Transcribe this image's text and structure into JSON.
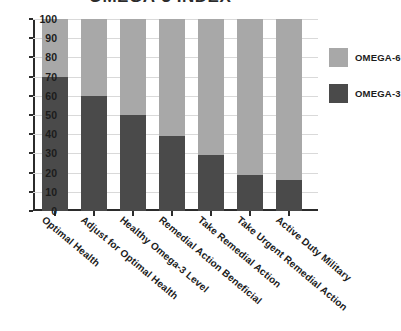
{
  "chart_data": {
    "type": "bar",
    "stacked": true,
    "title": "OMEGA-3 INDEX",
    "categories": [
      "Optimal Health",
      "Adjust for Optimal Health",
      "Healthy Omega-3 Level",
      "Remedial Action Beneficial",
      "Take Remedial Action",
      "Take Urgent Remedial Action",
      "Active Duty Military"
    ],
    "series": [
      {
        "name": "OMEGA-3",
        "color": "#4a4a4a",
        "values": [
          70,
          60,
          50,
          39,
          29,
          19,
          16
        ]
      },
      {
        "name": "OMEGA-6",
        "color": "#a8a8a8",
        "values": [
          30,
          40,
          50,
          61,
          71,
          81,
          84
        ]
      }
    ],
    "xlabel": "",
    "ylabel": "",
    "ylim": [
      0,
      100
    ],
    "yticks": [
      0,
      10,
      20,
      30,
      40,
      50,
      60,
      70,
      80,
      90,
      100
    ],
    "ytick_labels": [
      "0",
      "10",
      "20",
      "30",
      "40",
      "50",
      "60",
      "70",
      "80",
      "90",
      "100"
    ],
    "grid": true,
    "legend_position": "right"
  },
  "legend": {
    "items": [
      {
        "label": "OMEGA-6",
        "color": "#a8a8a8"
      },
      {
        "label": "OMEGA-3",
        "color": "#4a4a4a"
      }
    ]
  }
}
